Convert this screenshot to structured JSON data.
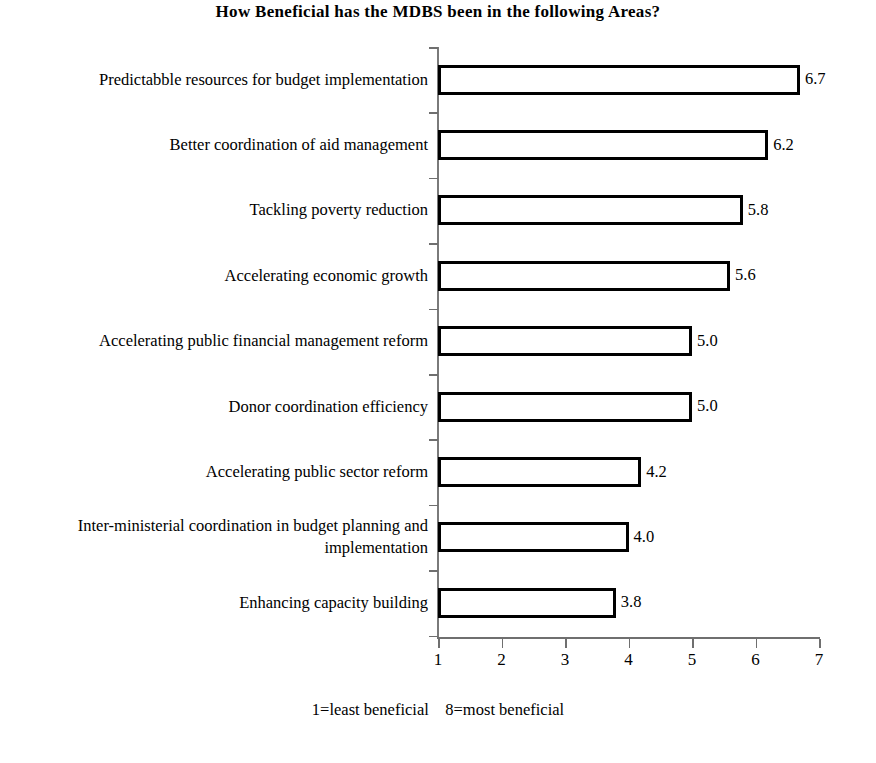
{
  "chart_data": {
    "type": "bar",
    "orientation": "horizontal",
    "title": "How Beneficial has the MDBS been in the following Areas?",
    "xlabel": "",
    "ylabel": "",
    "xlim": [
      1,
      7
    ],
    "xticks": [
      "1",
      "2",
      "3",
      "4",
      "5",
      "6",
      "7"
    ],
    "grid": false,
    "legend": null,
    "footnote": "1=least beneficial    8=most beneficial",
    "bar_style": {
      "fill": "#ffffff",
      "edge": "#000000"
    },
    "categories": [
      "Predictabble resources for budget implementation",
      "Better coordination of aid management",
      "Tackling poverty reduction",
      "Accelerating economic growth",
      "Accelerating public financial management reform",
      "Donor coordination efficiency",
      "Accelerating public sector reform",
      "Inter-ministerial coordination in budget planning and implementation",
      "Enhancing capacity building"
    ],
    "values": [
      6.7,
      6.2,
      5.8,
      5.6,
      5.0,
      5.0,
      4.2,
      4.0,
      3.8
    ],
    "value_labels": [
      "6.7",
      "6.2",
      "5.8",
      "5.6",
      "5.0",
      "5.0",
      "4.2",
      "4.0",
      "3.8"
    ]
  }
}
